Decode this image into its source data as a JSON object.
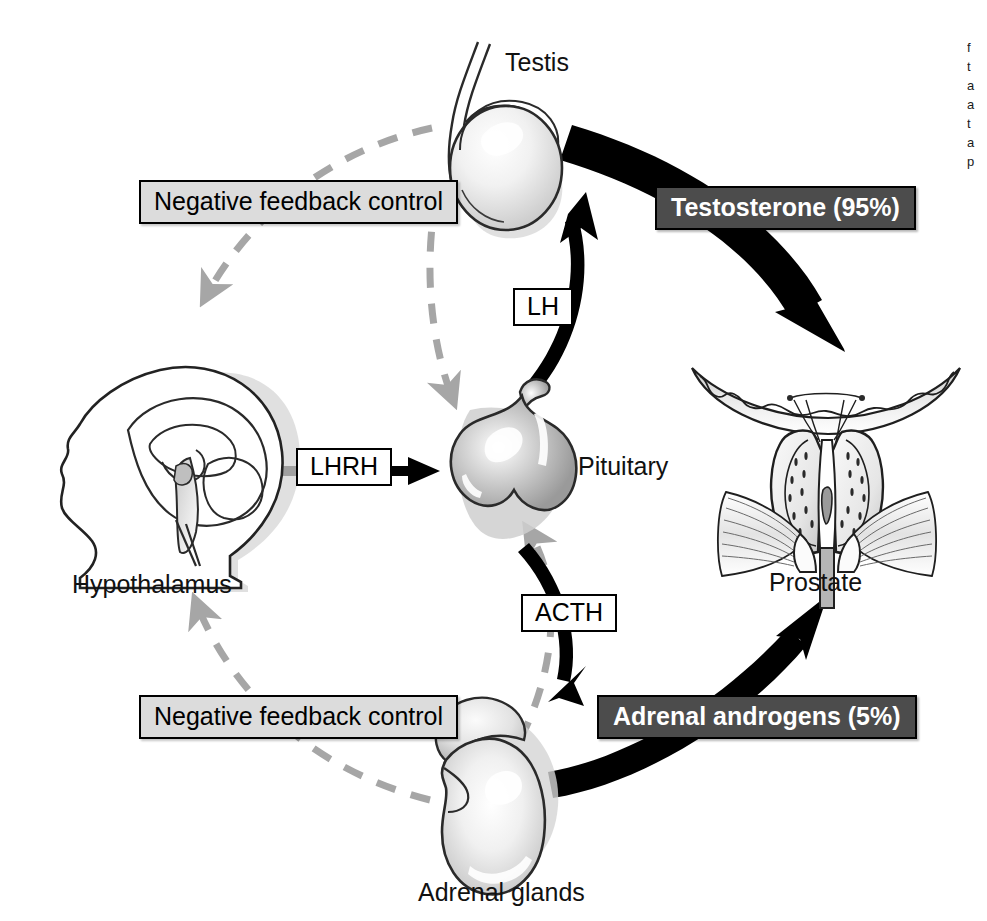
{
  "figure": {
    "type": "biological-pathway-diagram"
  },
  "organs": {
    "testis": {
      "label": "Testis"
    },
    "hypothalamus": {
      "label": "Hypothalamus"
    },
    "pituitary": {
      "label": "Pituitary"
    },
    "adrenal": {
      "label": "Adrenal glands"
    },
    "prostate": {
      "label": "Prostate"
    }
  },
  "hormone_tags": {
    "lhrh": {
      "label": "LHRH"
    },
    "lh": {
      "label": "LH"
    },
    "acth": {
      "label": "ACTH"
    }
  },
  "output_tags": {
    "testosterone": {
      "label": "Testosterone (95%)"
    },
    "adrenal_androgens": {
      "label": "Adrenal androgens (5%)"
    }
  },
  "feedback_tags": {
    "upper": {
      "label": "Negative feedback control"
    },
    "lower": {
      "label": "Negative feedback control"
    }
  },
  "margin_caption": {
    "lines": [
      "f",
      "t",
      "a",
      "a",
      "t",
      "a",
      "p"
    ]
  },
  "colors": {
    "dark_box_fill": "#4c4c4c",
    "dark_box_text": "#ffffff",
    "gray_box_fill": "#dcdcdc",
    "white_box_fill": "#ffffff",
    "stroke_black": "#000000",
    "dashed_gray": "#a6a6a6",
    "page_background": "#ffffff"
  }
}
